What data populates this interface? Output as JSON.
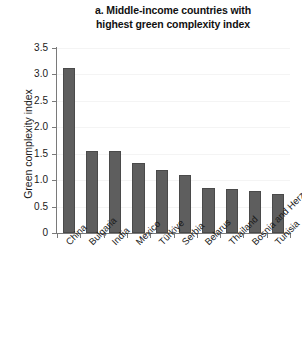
{
  "chart_data": {
    "type": "bar",
    "title": "a. Middle-income countries with highest green complexity index",
    "title_line1": "a. Middle-income countries with",
    "title_line2": "highest green complexity index",
    "xlabel": "",
    "ylabel": "Green complexity index",
    "ylim": [
      0,
      3.5
    ],
    "ytick_labels": [
      "3.5",
      "3.0",
      "2.5",
      "2.0",
      "1.5",
      "1.0",
      "0.5",
      "0"
    ],
    "ytick_values": [
      3.5,
      3.0,
      2.5,
      2.0,
      1.5,
      1.0,
      0.5,
      0
    ],
    "grid": true,
    "legend": "none",
    "bar_color": "#5e5e5e",
    "categories": [
      "China",
      "Bulgaria",
      "India",
      "Mexico",
      "Türkiye",
      "Serbia",
      "Belarus",
      "Thailand",
      "Bosnia and Herzegovina",
      "Tunisia"
    ],
    "values": [
      3.12,
      1.56,
      1.55,
      1.33,
      1.2,
      1.1,
      0.86,
      0.83,
      0.79,
      0.74
    ]
  }
}
